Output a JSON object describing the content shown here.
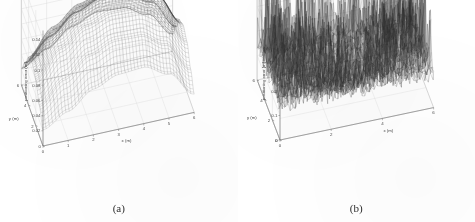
{
  "figure": {
    "background_color": "#ffffff",
    "panels": [
      {
        "caption": "(a)",
        "title": "average positioning error",
        "zlabel": "positioning error (m)",
        "xlabel": "x (m)",
        "ylabel": "y (m)",
        "z_ticks": [
          "0.14",
          "0.12",
          "0.1",
          "0.08",
          "0.06",
          "0.04",
          "0.02"
        ],
        "x_ticks": [
          "0",
          "1",
          "2",
          "3",
          "4",
          "5",
          "6"
        ],
        "y_ticks": [
          "0",
          "2",
          "4",
          "6"
        ]
      },
      {
        "caption": "(b)",
        "title": "average positioning error",
        "zlabel": "positioning error [m]",
        "xlabel": "x (m)",
        "ylabel": "y (m)",
        "z_ticks": [
          "0.4",
          "0.3",
          "0.2",
          "0.1",
          "0"
        ],
        "x_ticks": [
          "0",
          "2",
          "4",
          "6"
        ],
        "y_ticks": [
          "0",
          "2",
          "4",
          "6"
        ]
      }
    ]
  },
  "chart_data": [
    {
      "type": "surface",
      "panel": "(a)",
      "title": "average positioning error",
      "xlabel": "x (m)",
      "ylabel": "y (m)",
      "zlabel": "positioning error (m)",
      "xlim": [
        0,
        6
      ],
      "ylim": [
        0,
        6
      ],
      "zlim": [
        0.02,
        0.14
      ],
      "x_ticks": [
        0,
        1,
        2,
        3,
        4,
        5,
        6
      ],
      "y_ticks": [
        0,
        2,
        4,
        6
      ],
      "z_ticks": [
        0.02,
        0.04,
        0.06,
        0.08,
        0.1,
        0.12,
        0.14
      ],
      "grid": true,
      "legend": "none",
      "mesh_style": "fine dark wireframe, smooth dome",
      "description": "Smooth saddle/dome surface peaking near the centre-rear of the domain and falling steeply to the four corners.",
      "z_grid": [
        [
          0.021,
          0.038,
          0.06,
          0.072,
          0.074,
          0.058,
          0.024
        ],
        [
          0.04,
          0.068,
          0.092,
          0.104,
          0.103,
          0.084,
          0.044
        ],
        [
          0.06,
          0.094,
          0.116,
          0.126,
          0.125,
          0.11,
          0.066
        ],
        [
          0.068,
          0.104,
          0.126,
          0.137,
          0.134,
          0.118,
          0.074
        ],
        [
          0.062,
          0.096,
          0.118,
          0.128,
          0.126,
          0.112,
          0.068
        ],
        [
          0.042,
          0.07,
          0.094,
          0.106,
          0.104,
          0.086,
          0.046
        ],
        [
          0.022,
          0.04,
          0.062,
          0.074,
          0.072,
          0.056,
          0.023
        ]
      ]
    },
    {
      "type": "surface",
      "panel": "(b)",
      "title": "average positioning error",
      "xlabel": "x (m)",
      "ylabel": "y (m)",
      "zlabel": "positioning error [m]",
      "xlim": [
        0,
        6
      ],
      "ylim": [
        0,
        6
      ],
      "zlim": [
        0,
        0.4
      ],
      "x_ticks": [
        0,
        2,
        4,
        6
      ],
      "y_ticks": [
        0,
        2,
        4,
        6
      ],
      "z_ticks": [
        0,
        0.1,
        0.2,
        0.3,
        0.4
      ],
      "grid": true,
      "legend": "none",
      "mesh_style": "dense noisy wireframe with sharp spikes",
      "description": "Highly noisy surface averaging about 0.12 m with dense random spikes reaching up to roughly 0.42 m, strongest toward the edges and rear of the domain.",
      "mean_level": 0.12,
      "spike_max": 0.42,
      "noise_amplitude": 0.3
    }
  ]
}
